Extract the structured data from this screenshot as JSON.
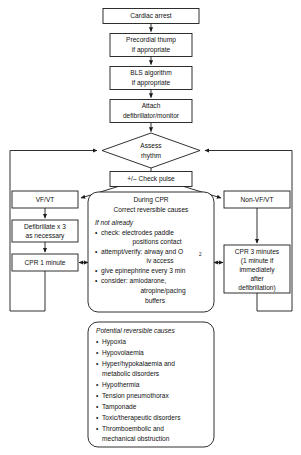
{
  "diagram": {
    "colors": {
      "stroke": "#1a1a1a",
      "fill": "#ffffff",
      "text": "#111111"
    },
    "nodes": {
      "cardiac_arrest": "Cardiac arrest",
      "precordial_thump_line1": "Precordial thump",
      "precordial_thump_line2": "if appropriate",
      "bls_line1": "BLS algorithm",
      "bls_line2": "if appropriate",
      "attach_line1": "Attach",
      "attach_line2": "defibrillator/monitor",
      "assess_line1": "Assess",
      "assess_line2": "rhythm",
      "check_pulse": "+/– Check pulse",
      "vf_vt": "VF/VT",
      "non_vf_vt": "Non-VF/VT",
      "defibrillate_line1": "Defibrillate x 3",
      "defibrillate_line2": "as necessary",
      "cpr_1_minute": "CPR 1 minute",
      "cpr_3_minutes_line1": "CPR 3 minutes",
      "cpr_3_minutes_line2": "(1 minute if",
      "cpr_3_minutes_line3": "immediately",
      "cpr_3_minutes_line4": "after",
      "cpr_3_minutes_line5": "defibrillation)"
    },
    "during_cpr": {
      "heading_line1": "During CPR",
      "heading_line2": "Correct reversible causes",
      "subheading": "If not already",
      "bullets": [
        {
          "line1": "check: electrodes paddle",
          "line2": "positions contact"
        },
        {
          "line1": "attempt/verify: airway and O",
          "sub": "2",
          "line2": "iv access"
        },
        {
          "line1": "give epinephrine every 3 min",
          "line2": ""
        },
        {
          "line1": "consider: amiodarone,",
          "line2": "atropine/pacing",
          "line3": "buffers"
        }
      ]
    },
    "reversible_causes": {
      "heading": "Potential reversible causes",
      "items": [
        {
          "line1": "Hypoxia",
          "line2": ""
        },
        {
          "line1": "Hypovolaemia",
          "line2": ""
        },
        {
          "line1": "Hyper/hypokalaemia and",
          "line2": "metabolic disorders"
        },
        {
          "line1": "Hypothermia",
          "line2": ""
        },
        {
          "line1": "Tension pneumothorax",
          "line2": ""
        },
        {
          "line1": "Tamponade",
          "line2": ""
        },
        {
          "line1": "Toxic/therapeutic disorders",
          "line2": ""
        },
        {
          "line1": "Thromboembolic and",
          "line2": "mechanical obstruction"
        }
      ]
    },
    "bullet_glyph": "•"
  }
}
